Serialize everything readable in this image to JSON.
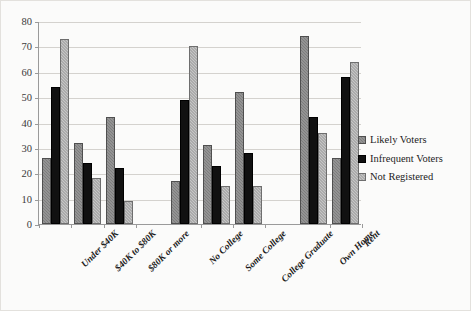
{
  "chart_data": {
    "type": "bar",
    "title": "",
    "subtitle": "",
    "xlabel": "",
    "ylabel": "",
    "ylim": [
      0,
      80
    ],
    "yticks": [
      0,
      10,
      20,
      30,
      40,
      50,
      60,
      70,
      80
    ],
    "grid": true,
    "legend_position": "right",
    "categories": [
      "Under $40K",
      "$40K to $80K",
      "$80K or more",
      "No College",
      "Some College",
      "College Graduate",
      "Own Home",
      "Rent"
    ],
    "category_gaps_after": [
      2,
      5
    ],
    "series": [
      {
        "name": "Likely Voters",
        "color": "#7d7d7d",
        "values": [
          26,
          32,
          42,
          17,
          31,
          52,
          74,
          26
        ]
      },
      {
        "name": "Infrequent Voters",
        "color": "#111111",
        "values": [
          54,
          24,
          22,
          49,
          23,
          28,
          42,
          58
        ]
      },
      {
        "name": "Not Registered",
        "color": "#c6c6c6",
        "values": [
          73,
          18,
          9,
          70,
          15,
          15,
          36,
          64
        ]
      }
    ]
  },
  "figure": {
    "background_color": "#fbfbfa",
    "border_color": "#e3e1dd",
    "axis_color": "#9a9a9a",
    "gridline_color": "#d4d2ce"
  }
}
